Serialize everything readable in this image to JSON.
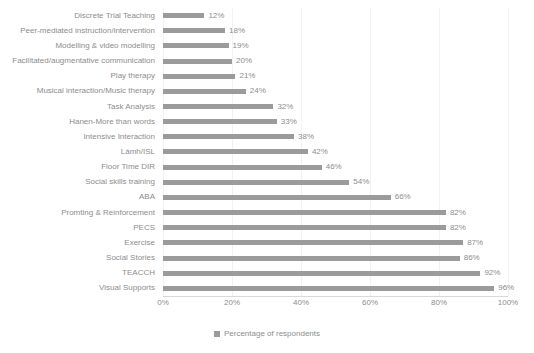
{
  "chart_data": {
    "type": "bar",
    "orientation": "horizontal",
    "title": "",
    "xlabel": "",
    "ylabel": "",
    "xlim": [
      0,
      100
    ],
    "grid": true,
    "legend_position": "bottom",
    "categories": [
      "Discrete Trial Teaching",
      "Peer-mediated instruction/intervention",
      "Modelling & video modelling",
      "Facilitated/augmentative communication",
      "Play therapy",
      "Musical interaction/Music therapy",
      "Task Analysis",
      "Hanen-More than words",
      "Intensive Interaction",
      "Lámh/ISL",
      "Floor Time DIR",
      "Social skills training",
      "ABA",
      "Promting & Reinforcement",
      "PECS",
      "Exercise",
      "Social Stories",
      "TEACCH",
      "Visual Supports"
    ],
    "values": [
      12,
      18,
      19,
      20,
      21,
      24,
      32,
      33,
      38,
      42,
      46,
      54,
      66,
      82,
      82,
      87,
      86,
      92,
      96
    ],
    "value_labels": [
      "12%",
      "18%",
      "19%",
      "20%",
      "21%",
      "24%",
      "32%",
      "33%",
      "38%",
      "42%",
      "46%",
      "54%",
      "66%",
      "82%",
      "82%",
      "87%",
      "86%",
      "92%",
      "96%"
    ],
    "xticks": [
      0,
      20,
      40,
      60,
      80,
      100
    ],
    "xtick_labels": [
      "0%",
      "20%",
      "40%",
      "60%",
      "80%",
      "100%"
    ],
    "series": [
      {
        "name": "Percentage of respondents",
        "color": "#9b9b9b",
        "values": [
          12,
          18,
          19,
          20,
          21,
          24,
          32,
          33,
          38,
          42,
          46,
          54,
          66,
          82,
          82,
          87,
          86,
          92,
          96
        ]
      }
    ],
    "legend": [
      {
        "label": "Percentage of respondents",
        "color": "#9b9b9b"
      }
    ]
  },
  "colors": {
    "bar": "#9b9b9b",
    "text": "#8d8d8d",
    "gridline": "#f2f2f2",
    "axis": "#d9d9d9",
    "background": "#ffffff"
  }
}
